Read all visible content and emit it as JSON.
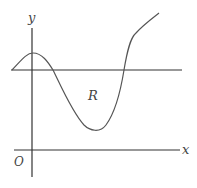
{
  "diagram": {
    "type": "function-graph",
    "labels": {
      "y_axis": "y",
      "x_axis": "x",
      "origin": "O",
      "region": "R"
    },
    "colors": {
      "axis": "#333333",
      "curve": "#555555",
      "line": "#333333",
      "text": "#444444"
    },
    "elements": [
      "x-axis",
      "y-axis",
      "horizontal line y = k",
      "curve y = f(x)",
      "shaded-less region R between curve and line"
    ]
  }
}
